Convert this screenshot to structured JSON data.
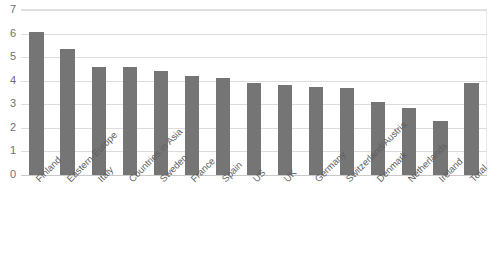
{
  "chart_data": {
    "type": "bar",
    "title": "",
    "xlabel": "",
    "ylabel": "",
    "ylim": [
      0,
      7
    ],
    "ytick_step": 1,
    "yticks": [
      "7",
      "6",
      "5",
      "4",
      "3",
      "2",
      "1",
      "0"
    ],
    "grid": true,
    "legend": "none",
    "bar_color": "#757575",
    "gridline_color": "#dcdcdc",
    "categories": [
      "Finland",
      "Eastern-Europe",
      "Italy",
      "Countries in Asia",
      "Sweden",
      "France",
      "Spain",
      "US",
      "UK",
      "Germany",
      "Switzerland/Austria",
      "Denmark",
      "Netherlands",
      "Ireland",
      "Total"
    ],
    "values": [
      6.05,
      5.35,
      4.6,
      4.57,
      4.4,
      4.2,
      4.12,
      3.9,
      3.8,
      3.75,
      3.7,
      3.1,
      2.85,
      2.3,
      3.9
    ]
  }
}
